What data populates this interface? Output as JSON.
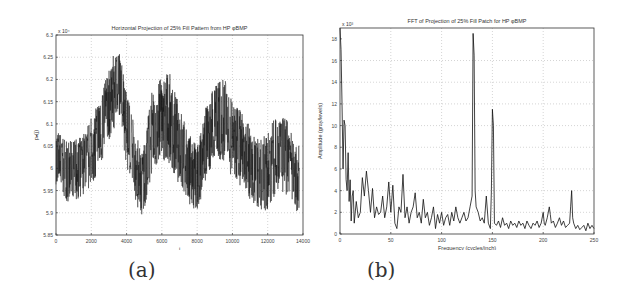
{
  "captions": {
    "a": "(a)",
    "b": "(b)"
  },
  "chart_data": [
    {
      "type": "line",
      "title": "Horizontal Projection of 25% Fill Pattern from HP φBMP",
      "xlabel": "i",
      "ylabel": "pₙ(j)",
      "y_multiplier": "x 10⁴",
      "xlim": [
        0,
        14000
      ],
      "ylim": [
        5.85,
        6.3
      ],
      "xticks": [
        0,
        2000,
        4000,
        6000,
        8000,
        10000,
        12000,
        14000
      ],
      "yticks": [
        5.85,
        5.9,
        5.95,
        6.0,
        6.05,
        6.1,
        6.15,
        6.2,
        6.25,
        6.3
      ],
      "xtick_labels": [
        "0",
        "2000",
        "4000",
        "6000",
        "8000",
        "10000",
        "12000",
        "14000"
      ],
      "ytick_labels": [
        "5.85",
        "5.9",
        "5.95",
        "6",
        "6.05",
        "6.1",
        "6.15",
        "6.2",
        "6.25",
        "6.3"
      ],
      "grid": true,
      "envelope": {
        "x": [
          0,
          700,
          1400,
          2200,
          2900,
          3300,
          3600,
          4000,
          4500,
          4900,
          5400,
          5900,
          6400,
          7000,
          7500,
          8000,
          8500,
          9000,
          9500,
          10000,
          10500,
          11000,
          11500,
          12000,
          12500,
          13000,
          13500,
          13800
        ],
        "mean": [
          6.02,
          5.99,
          6.0,
          6.05,
          6.12,
          6.18,
          6.2,
          6.1,
          6.0,
          5.96,
          6.07,
          6.1,
          6.1,
          6.05,
          6.0,
          5.96,
          6.05,
          6.1,
          6.1,
          6.06,
          6.05,
          6.02,
          5.98,
          6.0,
          6.04,
          6.04,
          5.98,
          5.97
        ],
        "min": [
          5.96,
          5.92,
          5.93,
          5.97,
          6.04,
          6.09,
          6.12,
          6.0,
          5.92,
          5.89,
          5.98,
          6.02,
          6.01,
          5.96,
          5.92,
          5.9,
          5.97,
          6.02,
          6.01,
          5.97,
          5.96,
          5.93,
          5.91,
          5.9,
          5.95,
          5.94,
          5.9,
          5.9
        ],
        "max": [
          6.09,
          6.06,
          6.07,
          6.13,
          6.21,
          6.26,
          6.26,
          6.19,
          6.08,
          6.04,
          6.17,
          6.2,
          6.22,
          6.14,
          6.08,
          6.05,
          6.14,
          6.19,
          6.21,
          6.15,
          6.13,
          6.11,
          6.06,
          6.09,
          6.12,
          6.12,
          6.06,
          6.05
        ]
      }
    },
    {
      "type": "line",
      "title": "FFT of Projection of 25% Fill Patch for HP φBMP",
      "xlabel": "Frequency (cycles/inch)",
      "ylabel": "Amplitude (gray/levels)",
      "y_multiplier": "x 10³",
      "xlim": [
        0,
        250
      ],
      "ylim": [
        0,
        19
      ],
      "xticks": [
        0,
        50,
        100,
        150,
        200,
        250
      ],
      "yticks": [
        0,
        2,
        4,
        6,
        8,
        10,
        12,
        14,
        16,
        18
      ],
      "xtick_labels": [
        "0",
        "50",
        "100",
        "150",
        "200",
        "250"
      ],
      "ytick_labels": [
        "0",
        "2",
        "4",
        "6",
        "8",
        "10",
        "12",
        "14",
        "16",
        "18"
      ],
      "grid": true,
      "x": [
        0,
        1,
        2,
        3,
        4,
        5,
        6,
        7,
        8,
        9,
        10,
        11,
        12,
        13,
        14,
        16,
        18,
        20,
        22,
        24,
        26,
        28,
        30,
        32,
        34,
        36,
        38,
        40,
        42,
        44,
        46,
        48,
        50,
        52,
        54,
        56,
        58,
        60,
        62,
        64,
        66,
        68,
        70,
        72,
        74,
        76,
        78,
        80,
        82,
        84,
        86,
        88,
        90,
        92,
        94,
        96,
        98,
        100,
        102,
        104,
        106,
        108,
        110,
        112,
        114,
        116,
        118,
        120,
        122,
        124,
        126,
        128,
        130,
        131,
        132,
        133,
        134,
        136,
        138,
        140,
        142,
        144,
        146,
        148,
        149,
        150,
        151,
        152,
        154,
        156,
        158,
        160,
        162,
        164,
        166,
        168,
        170,
        172,
        174,
        176,
        178,
        180,
        182,
        184,
        186,
        188,
        190,
        192,
        194,
        196,
        198,
        200,
        201,
        202,
        204,
        206,
        207,
        208,
        210,
        212,
        214,
        216,
        218,
        220,
        222,
        224,
        226,
        227,
        228,
        229,
        230,
        232,
        234,
        236,
        238,
        240,
        242,
        244,
        246,
        248,
        250
      ],
      "y": [
        19,
        17,
        12,
        6,
        10.5,
        10,
        5,
        4,
        7.5,
        3,
        5,
        1.2,
        3.5,
        4,
        1,
        3,
        1.5,
        2,
        5.2,
        3.5,
        5.8,
        4,
        2,
        4.2,
        1.5,
        2.5,
        1.8,
        2,
        3.5,
        1.5,
        2.5,
        4.8,
        2,
        4.5,
        1,
        0.5,
        2.5,
        2,
        5.5,
        1.5,
        2.5,
        1,
        2,
        2.5,
        3.8,
        1.5,
        2,
        1,
        3.2,
        1.5,
        2,
        0.8,
        1.5,
        2.5,
        0.5,
        1.8,
        1,
        2,
        0.8,
        1.5,
        1.8,
        0.8,
        2,
        1.2,
        2.5,
        1.5,
        1,
        1.5,
        2,
        1.2,
        1.5,
        2.5,
        3.5,
        18.5,
        16.5,
        4,
        2.5,
        2,
        1.2,
        1.5,
        1,
        3.5,
        1,
        0.5,
        4,
        11.5,
        10,
        1,
        0.8,
        1.2,
        0.6,
        1.5,
        0.8,
        1,
        0.5,
        1.2,
        0.8,
        1,
        0.6,
        1.2,
        0.8,
        1,
        0.5,
        1.2,
        0.8,
        0.5,
        1,
        0.8,
        1.2,
        0.6,
        1,
        2,
        1,
        0.8,
        1.5,
        2.5,
        1.8,
        1,
        1.2,
        0.6,
        1,
        1.5,
        0.8,
        1.2,
        0.6,
        0.8,
        1,
        2.5,
        4,
        1.5,
        1,
        0.5,
        0.8,
        0.4,
        0.6,
        0.8,
        0.3,
        1,
        0.5,
        0.8,
        0.5,
        0.7
      ],
      "peaks": [
        {
          "x": 0,
          "y": 19
        },
        {
          "x": 132,
          "y": 18.5
        },
        {
          "x": 150,
          "y": 11.5
        },
        {
          "x": 228,
          "y": 4
        }
      ]
    }
  ]
}
